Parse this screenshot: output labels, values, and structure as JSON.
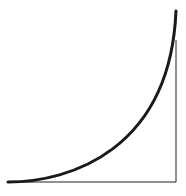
{
  "diagram": {
    "curve": {
      "start": [
        8,
        182
      ],
      "c1": [
        70,
        182
      ],
      "c2": [
        170,
        150
      ],
      "end": [
        176,
        11
      ],
      "color": "#1a1a1a",
      "width": 3
    },
    "baseline": {
      "x1": 8,
      "y1": 182,
      "x2": 176,
      "y2": 182,
      "color": "#222222",
      "width": 1
    },
    "vertical_line": {
      "x1": 176,
      "y1": 40,
      "x2": 176,
      "y2": 182,
      "color": "#222222",
      "width": 1
    }
  }
}
